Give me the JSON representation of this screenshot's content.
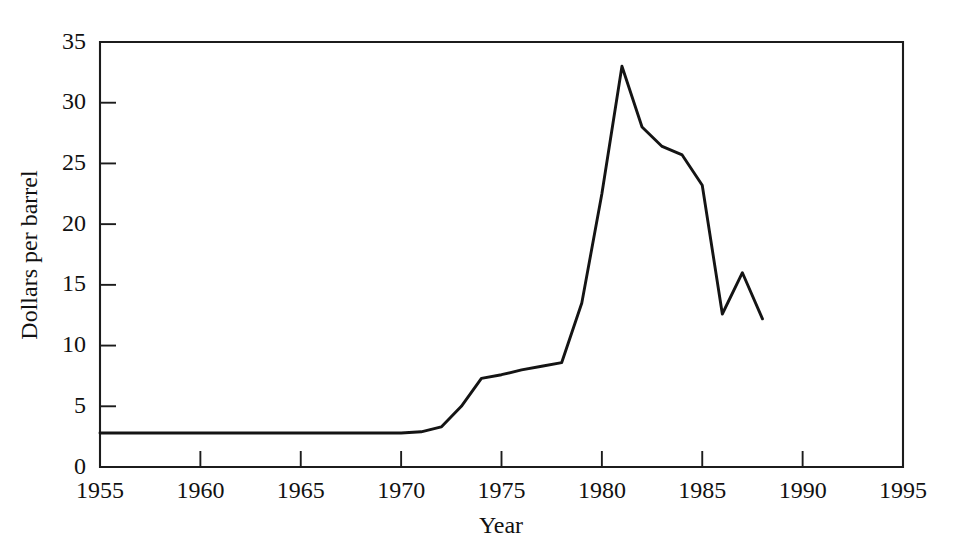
{
  "page": {
    "partial_top_line": "",
    "background_color": "#ffffff",
    "ink_color": "#141414"
  },
  "chart_data": {
    "type": "line",
    "title": "",
    "xlabel": "Year",
    "ylabel": "Dollars per barrel",
    "xlim": [
      1955,
      1995
    ],
    "ylim": [
      0,
      35
    ],
    "xticks": [
      1955,
      1960,
      1965,
      1970,
      1975,
      1980,
      1985,
      1990,
      1995
    ],
    "xtick_labels": [
      "1955",
      "1960",
      "1965",
      "1970",
      "1975",
      "1980",
      "1985",
      "1990",
      "1995"
    ],
    "yticks": [
      0,
      5,
      10,
      15,
      20,
      25,
      30,
      35
    ],
    "ytick_labels": [
      "0",
      "5",
      "10",
      "15",
      "20",
      "25",
      "30",
      "35"
    ],
    "grid": false,
    "legend": false,
    "legend_position": "none",
    "frame": "box",
    "series": [
      {
        "name": "Crude oil price",
        "color": "#141414",
        "line_width": 2.9,
        "x": [
          1955,
          1956,
          1957,
          1958,
          1959,
          1960,
          1961,
          1962,
          1963,
          1964,
          1965,
          1966,
          1967,
          1968,
          1969,
          1970,
          1971,
          1972,
          1973,
          1974,
          1975,
          1976,
          1977,
          1978,
          1979,
          1980,
          1981,
          1982,
          1983,
          1984,
          1985,
          1986,
          1987,
          1988
        ],
        "values": [
          2.8,
          2.8,
          2.8,
          2.8,
          2.8,
          2.8,
          2.8,
          2.8,
          2.8,
          2.8,
          2.8,
          2.8,
          2.8,
          2.8,
          2.8,
          2.8,
          2.9,
          3.3,
          5.0,
          7.3,
          7.6,
          8.0,
          8.3,
          8.6,
          13.5,
          22.5,
          33.0,
          28.0,
          26.4,
          25.7,
          23.2,
          12.6,
          16.0,
          12.2
        ]
      }
    ]
  }
}
